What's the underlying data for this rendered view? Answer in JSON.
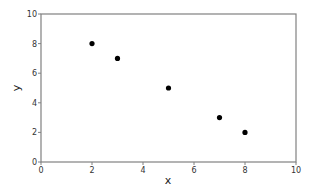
{
  "chart_data": {
    "type": "scatter",
    "title": "",
    "xlabel": "x",
    "ylabel": "y",
    "xlim": [
      0,
      10
    ],
    "ylim": [
      0,
      10
    ],
    "xticks": [
      0,
      2,
      4,
      6,
      8,
      10
    ],
    "yticks": [
      0,
      2,
      4,
      6,
      8,
      10
    ],
    "grid": false,
    "legend": null,
    "series": [
      {
        "name": "points",
        "color": "#000000",
        "points": [
          {
            "x": 2,
            "y": 8
          },
          {
            "x": 3,
            "y": 7
          },
          {
            "x": 5,
            "y": 5
          },
          {
            "x": 7,
            "y": 3
          },
          {
            "x": 8,
            "y": 2
          }
        ]
      }
    ]
  },
  "colors": {
    "axis": "#808080",
    "marker": "#000000",
    "background": "#ffffff"
  }
}
